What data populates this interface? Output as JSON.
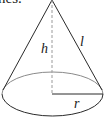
{
  "caption": {
    "text": "nes."
  },
  "diagram": {
    "labels": {
      "height": "h",
      "slant": "l",
      "radius": "r"
    },
    "colors": {
      "stroke": "#2a2a2a",
      "back_arc": "#8a8a8a",
      "dashed": "#9a9a9a"
    }
  }
}
